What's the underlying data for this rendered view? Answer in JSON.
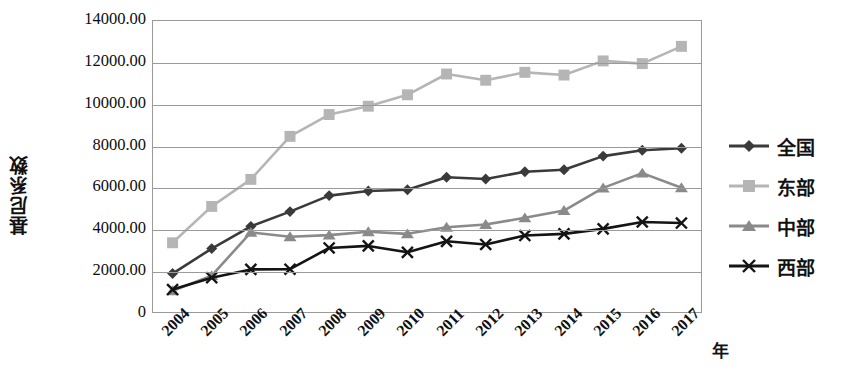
{
  "chart_data": {
    "type": "line",
    "title": "",
    "xlabel": "年",
    "ylabel": "基尼系数",
    "x": [
      "2004",
      "2005",
      "2006",
      "2007",
      "2008",
      "2009",
      "2010",
      "2011",
      "2012",
      "2013",
      "2014",
      "2015",
      "2016",
      "2017"
    ],
    "ylim": [
      0,
      14000
    ],
    "ytick_labels": [
      "0",
      "2000.00",
      "4000.00",
      "6000.00",
      "8000.00",
      "10000.00",
      "12000.00",
      "14000.00"
    ],
    "ytick_values": [
      0,
      2000,
      4000,
      6000,
      8000,
      10000,
      12000,
      14000
    ],
    "grid": true,
    "legend_position": "right",
    "series": [
      {
        "name": "全国",
        "marker": "diamond",
        "color": "#3a3a3a",
        "values": [
          1850,
          3050,
          4120,
          4830,
          5600,
          5820,
          5880,
          6480,
          6400,
          6750,
          6840,
          7500,
          7780,
          7880
        ]
      },
      {
        "name": "东部",
        "marker": "square",
        "color": "#b5b5b5",
        "values": [
          3330,
          5080,
          6380,
          8450,
          9500,
          9900,
          10450,
          11450,
          11150,
          11530,
          11400,
          12080,
          11950,
          12780
        ]
      },
      {
        "name": "中部",
        "marker": "triangle",
        "color": "#8a8a8a",
        "values": [
          1020,
          1750,
          3830,
          3620,
          3700,
          3860,
          3760,
          4080,
          4210,
          4530,
          4880,
          5970,
          6680,
          5980
        ]
      },
      {
        "name": "西部",
        "marker": "cross",
        "color": "#141414",
        "values": [
          1080,
          1650,
          2050,
          2060,
          3080,
          3180,
          2870,
          3400,
          3250,
          3680,
          3760,
          4000,
          4330,
          4280
        ]
      }
    ]
  },
  "legend": {
    "items": [
      {
        "label": "全国",
        "marker": "diamond",
        "color": "#3a3a3a"
      },
      {
        "label": "东部",
        "marker": "square",
        "color": "#b5b5b5"
      },
      {
        "label": "中部",
        "marker": "triangle",
        "color": "#8a8a8a"
      },
      {
        "label": "西部",
        "marker": "cross",
        "color": "#141414"
      }
    ]
  }
}
